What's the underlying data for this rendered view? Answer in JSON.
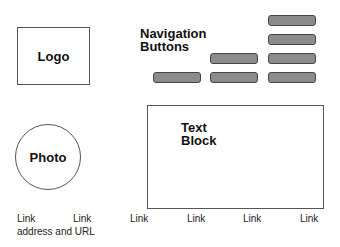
{
  "logo": {
    "label": "Logo"
  },
  "navigation": {
    "title_line1": "Navigation",
    "title_line2": "Buttons",
    "button_color": "#8c8c8c",
    "columns": [
      {
        "buttons": 1
      },
      {
        "buttons": 2
      },
      {
        "buttons": 4
      }
    ]
  },
  "photo": {
    "label": "Photo"
  },
  "text_block": {
    "line1": "Text",
    "line2": "Block"
  },
  "footer": {
    "links": [
      "Link",
      "Link",
      "Link",
      "Link",
      "Link",
      "Link"
    ],
    "address": "address and URL"
  }
}
